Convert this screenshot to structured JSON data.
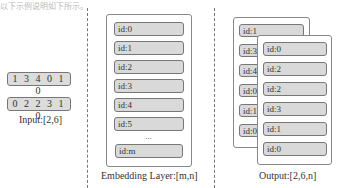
{
  "header_text": "以下示例说明如下所示。",
  "input": {
    "rows": [
      "1 3 4 0 1 0",
      "0 2 2 3 1 0"
    ],
    "caption": "Input:[2,6]"
  },
  "embedding": {
    "items": [
      "id:0",
      "id:1",
      "id:2",
      "id:3",
      "id:4",
      "id:5"
    ],
    "ellipsis": "...",
    "last_item": "id:m",
    "caption": "Embedding Layer:[m,n]"
  },
  "output": {
    "back_items": [
      "id:1",
      "id:3",
      "id:4",
      "id:0",
      "id:1",
      "id:0"
    ],
    "front_items": [
      "id:0",
      "id:2",
      "id:2",
      "id:3",
      "id:1",
      "id:0"
    ],
    "caption": "Output:[2,6,n]"
  }
}
